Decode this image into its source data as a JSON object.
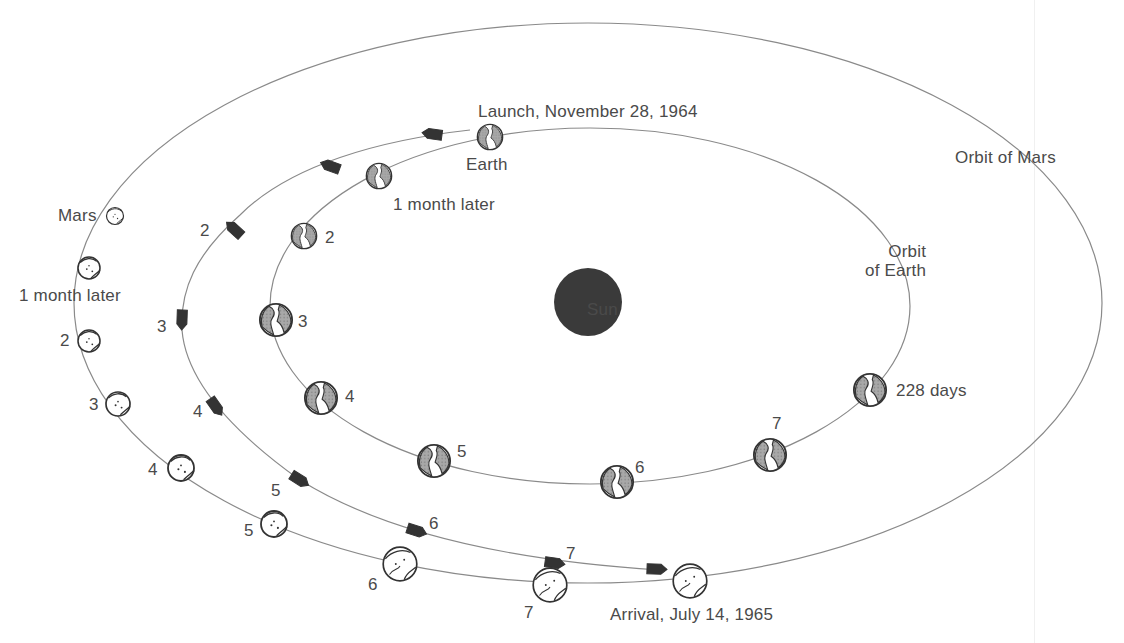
{
  "diagram": {
    "sun": {
      "label": "Sun",
      "color": "#3a3a3a"
    },
    "earth_orbit": {
      "label_line1": "Orbit",
      "label_line2": "of Earth"
    },
    "mars_orbit": {
      "label": "Orbit of Mars"
    },
    "launch": {
      "label": "Launch, November 28, 1964",
      "planet_label": "Earth"
    },
    "arrival": {
      "label": "Arrival, July 14, 1965"
    },
    "earth_positions": [
      {
        "label": "1 month later"
      },
      {
        "label": "2"
      },
      {
        "label": "3"
      },
      {
        "label": "4"
      },
      {
        "label": "5"
      },
      {
        "label": "6"
      },
      {
        "label": "7"
      },
      {
        "label": "228 days"
      }
    ],
    "mars_positions": [
      {
        "label": "Mars"
      },
      {
        "label": "1 month later"
      },
      {
        "label": "2"
      },
      {
        "label": "3"
      },
      {
        "label": "4"
      },
      {
        "label": "5"
      },
      {
        "label": "6"
      },
      {
        "label": "7"
      }
    ],
    "spacecraft_positions": [
      {
        "label": "2"
      },
      {
        "label": "3"
      },
      {
        "label": "4"
      },
      {
        "label": "5"
      },
      {
        "label": "6"
      },
      {
        "label": "7"
      }
    ],
    "colors": {
      "line": "#8a8a8a",
      "text": "#4a4a4a",
      "earth_fill": "#9a9a9a",
      "spacecraft": "#333333"
    }
  }
}
